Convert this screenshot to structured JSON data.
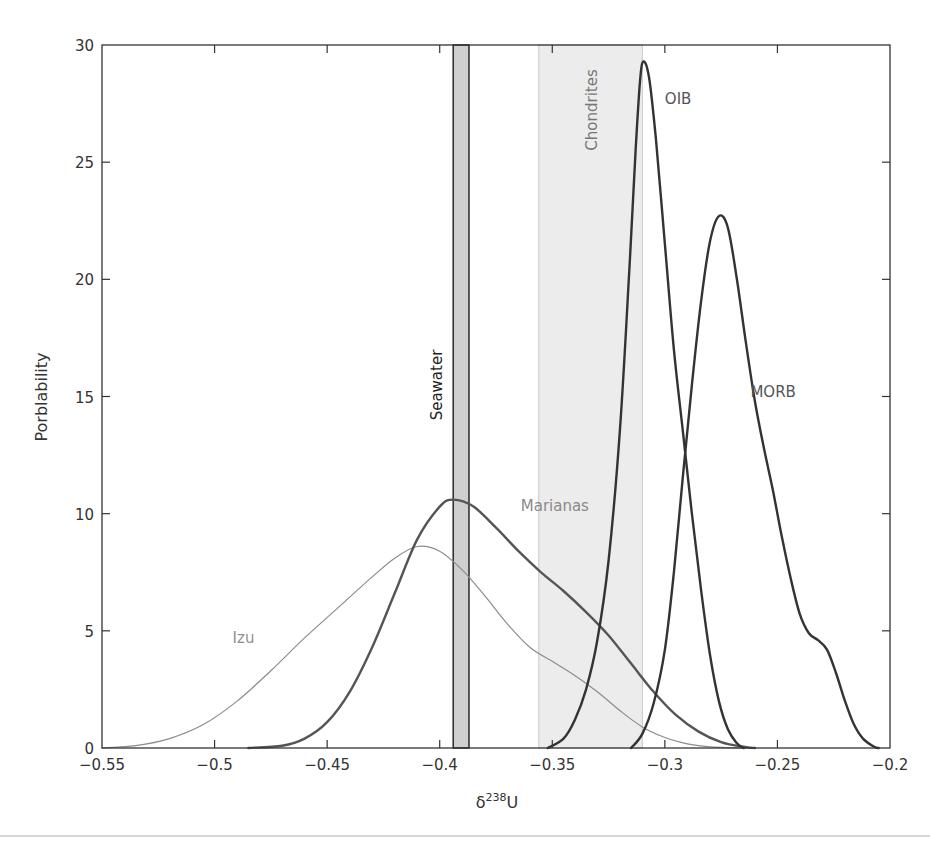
{
  "chart_data": {
    "type": "line",
    "title": "",
    "xlabel": "δ238U",
    "xlabel_parts": {
      "base": "δ",
      "sup": "238",
      "tail": "U"
    },
    "ylabel": "Porblability",
    "xlim": [
      -0.55,
      -0.2
    ],
    "ylim": [
      0,
      30
    ],
    "grid": false,
    "legend": "inline labels",
    "x_ticks": [
      -0.55,
      -0.5,
      -0.45,
      -0.4,
      -0.35,
      -0.3,
      -0.25,
      -0.2
    ],
    "x_tick_labels": [
      "−0.55",
      "−0.5",
      "−0.45",
      "−0.4",
      "−0.35",
      "−0.3",
      "−0.25",
      "−0.2"
    ],
    "y_ticks": [
      0,
      5,
      10,
      15,
      20,
      25,
      30
    ],
    "y_tick_labels": [
      "0",
      "5",
      "10",
      "15",
      "20",
      "25",
      "30"
    ],
    "bands": [
      {
        "name": "Seawater",
        "x_range": [
          -0.394,
          -0.387
        ],
        "fill": "#cfcfcf",
        "edge": "#333333",
        "label_color": "#222222"
      },
      {
        "name": "Chondrites",
        "x_range": [
          -0.356,
          -0.31
        ],
        "fill": "#ececec",
        "edge": "#c8c8c8",
        "label_color": "#777777"
      }
    ],
    "series": [
      {
        "name": "Izu",
        "color": "#8c8c8c",
        "width": 1.2,
        "label_pos": [
          -0.492,
          4.5
        ],
        "label_color": "#8f8f8f",
        "points": [
          [
            -0.55,
            0
          ],
          [
            -0.535,
            0.1
          ],
          [
            -0.52,
            0.4
          ],
          [
            -0.505,
            1.0
          ],
          [
            -0.49,
            2.0
          ],
          [
            -0.475,
            3.3
          ],
          [
            -0.46,
            4.7
          ],
          [
            -0.445,
            6.0
          ],
          [
            -0.43,
            7.3
          ],
          [
            -0.42,
            8.1
          ],
          [
            -0.41,
            8.6
          ],
          [
            -0.4,
            8.4
          ],
          [
            -0.39,
            7.6
          ],
          [
            -0.38,
            6.5
          ],
          [
            -0.37,
            5.3
          ],
          [
            -0.36,
            4.3
          ],
          [
            -0.35,
            3.7
          ],
          [
            -0.34,
            3.1
          ],
          [
            -0.33,
            2.4
          ],
          [
            -0.32,
            1.6
          ],
          [
            -0.31,
            0.9
          ],
          [
            -0.3,
            0.45
          ],
          [
            -0.29,
            0.18
          ],
          [
            -0.28,
            0.05
          ],
          [
            -0.265,
            0
          ]
        ]
      },
      {
        "name": "Marianas",
        "color": "#555555",
        "width": 2.4,
        "label_pos": [
          -0.364,
          10.1
        ],
        "label_color": "#8a8a8a",
        "points": [
          [
            -0.485,
            0
          ],
          [
            -0.47,
            0.1
          ],
          [
            -0.46,
            0.4
          ],
          [
            -0.45,
            1.1
          ],
          [
            -0.44,
            2.4
          ],
          [
            -0.43,
            4.3
          ],
          [
            -0.42,
            6.6
          ],
          [
            -0.41,
            8.9
          ],
          [
            -0.4,
            10.3
          ],
          [
            -0.394,
            10.6
          ],
          [
            -0.385,
            10.3
          ],
          [
            -0.375,
            9.4
          ],
          [
            -0.365,
            8.4
          ],
          [
            -0.355,
            7.5
          ],
          [
            -0.345,
            6.7
          ],
          [
            -0.335,
            5.8
          ],
          [
            -0.325,
            4.8
          ],
          [
            -0.315,
            3.6
          ],
          [
            -0.305,
            2.4
          ],
          [
            -0.295,
            1.4
          ],
          [
            -0.285,
            0.7
          ],
          [
            -0.275,
            0.25
          ],
          [
            -0.265,
            0.05
          ],
          [
            -0.26,
            0
          ]
        ]
      },
      {
        "name": "OIB",
        "color": "#333333",
        "width": 2.4,
        "label_pos": [
          -0.3,
          27.5
        ],
        "label_color": "#555555",
        "points": [
          [
            -0.352,
            0
          ],
          [
            -0.345,
            0.4
          ],
          [
            -0.34,
            1.2
          ],
          [
            -0.335,
            2.5
          ],
          [
            -0.33,
            4.6
          ],
          [
            -0.325,
            8.0
          ],
          [
            -0.32,
            13.5
          ],
          [
            -0.316,
            20.0
          ],
          [
            -0.313,
            25.5
          ],
          [
            -0.311,
            28.5
          ],
          [
            -0.3095,
            29.3
          ],
          [
            -0.307,
            28.6
          ],
          [
            -0.304,
            26.0
          ],
          [
            -0.3,
            21.5
          ],
          [
            -0.296,
            17.0
          ],
          [
            -0.292,
            13.5
          ],
          [
            -0.288,
            10.0
          ],
          [
            -0.284,
            6.8
          ],
          [
            -0.28,
            4.0
          ],
          [
            -0.276,
            2.0
          ],
          [
            -0.272,
            0.8
          ],
          [
            -0.268,
            0.2
          ],
          [
            -0.265,
            0
          ]
        ]
      },
      {
        "name": "MORB",
        "color": "#333333",
        "width": 2.4,
        "label_pos": [
          -0.262,
          15.0
        ],
        "label_color": "#555555",
        "points": [
          [
            -0.315,
            0
          ],
          [
            -0.31,
            0.6
          ],
          [
            -0.305,
            1.9
          ],
          [
            -0.3,
            4.2
          ],
          [
            -0.296,
            7.5
          ],
          [
            -0.292,
            11.6
          ],
          [
            -0.288,
            15.5
          ],
          [
            -0.284,
            19.0
          ],
          [
            -0.28,
            21.6
          ],
          [
            -0.276,
            22.7
          ],
          [
            -0.272,
            22.2
          ],
          [
            -0.268,
            20.0
          ],
          [
            -0.264,
            17.3
          ],
          [
            -0.26,
            14.8
          ],
          [
            -0.256,
            12.8
          ],
          [
            -0.252,
            11.0
          ],
          [
            -0.248,
            9.0
          ],
          [
            -0.244,
            7.2
          ],
          [
            -0.24,
            5.7
          ],
          [
            -0.236,
            4.9
          ],
          [
            -0.232,
            4.6
          ],
          [
            -0.228,
            4.2
          ],
          [
            -0.224,
            3.2
          ],
          [
            -0.22,
            2.0
          ],
          [
            -0.216,
            1.0
          ],
          [
            -0.212,
            0.4
          ],
          [
            -0.207,
            0.05
          ],
          [
            -0.205,
            0
          ]
        ]
      }
    ],
    "frame_color": "#333333"
  }
}
